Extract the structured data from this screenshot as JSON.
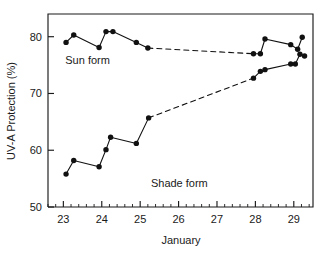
{
  "chart_data": {
    "type": "line",
    "title": "",
    "xlabel": "January",
    "ylabel": "UV-A Protection (%)",
    "xlim": [
      22.6,
      29.5
    ],
    "ylim": [
      50,
      84
    ],
    "xticks": [
      23,
      24,
      25,
      26,
      27,
      28,
      29
    ],
    "xticklabels": [
      "23",
      "24",
      "25",
      "26",
      "27",
      "28",
      "29"
    ],
    "x_minor_step": 0.2,
    "yticks": [
      50,
      60,
      70,
      80
    ],
    "yticklabels": [
      "50",
      "60",
      "70",
      "80"
    ],
    "grid": false,
    "legend_position": "inline-annotations",
    "marker": "filled-circle",
    "marker_color": "#111111",
    "line_color": "#111111",
    "series": [
      {
        "name": "Sun form",
        "label_x": 23.05,
        "label_y": 75.2,
        "segments": [
          {
            "style": "solid",
            "points": [
              {
                "x": 23.07,
                "y": 79.0
              },
              {
                "x": 23.27,
                "y": 80.3
              },
              {
                "x": 23.93,
                "y": 78.1
              },
              {
                "x": 24.11,
                "y": 80.9
              },
              {
                "x": 24.29,
                "y": 80.9
              },
              {
                "x": 24.9,
                "y": 79.0
              },
              {
                "x": 25.2,
                "y": 78.0
              }
            ]
          },
          {
            "style": "dashed",
            "points": [
              {
                "x": 25.2,
                "y": 78.0
              },
              {
                "x": 27.95,
                "y": 77.0
              }
            ]
          },
          {
            "style": "solid",
            "points": [
              {
                "x": 27.95,
                "y": 77.0
              },
              {
                "x": 28.13,
                "y": 77.0
              },
              {
                "x": 28.25,
                "y": 79.6
              },
              {
                "x": 28.92,
                "y": 78.6
              },
              {
                "x": 29.1,
                "y": 77.8
              },
              {
                "x": 29.22,
                "y": 79.9
              }
            ]
          }
        ],
        "values": [
          {
            "x": 23.07,
            "y": 79.0
          },
          {
            "x": 23.27,
            "y": 80.3
          },
          {
            "x": 23.93,
            "y": 78.1
          },
          {
            "x": 24.11,
            "y": 80.9
          },
          {
            "x": 24.29,
            "y": 80.9
          },
          {
            "x": 24.9,
            "y": 79.0
          },
          {
            "x": 25.2,
            "y": 78.0
          },
          {
            "x": 27.95,
            "y": 77.0
          },
          {
            "x": 28.13,
            "y": 77.0
          },
          {
            "x": 28.25,
            "y": 79.6
          },
          {
            "x": 28.92,
            "y": 78.6
          },
          {
            "x": 29.1,
            "y": 77.8
          },
          {
            "x": 29.22,
            "y": 79.9
          }
        ]
      },
      {
        "name": "Shade form",
        "label_x": 25.28,
        "label_y": 53.6,
        "segments": [
          {
            "style": "solid",
            "points": [
              {
                "x": 23.07,
                "y": 55.8
              },
              {
                "x": 23.27,
                "y": 58.2
              },
              {
                "x": 23.93,
                "y": 57.1
              },
              {
                "x": 24.11,
                "y": 60.1
              },
              {
                "x": 24.23,
                "y": 62.3
              },
              {
                "x": 24.9,
                "y": 61.2
              },
              {
                "x": 25.22,
                "y": 65.7
              }
            ]
          },
          {
            "style": "dashed",
            "points": [
              {
                "x": 25.22,
                "y": 65.7
              },
              {
                "x": 27.95,
                "y": 72.7
              }
            ]
          },
          {
            "style": "solid",
            "points": [
              {
                "x": 27.95,
                "y": 72.7
              },
              {
                "x": 28.13,
                "y": 73.9
              },
              {
                "x": 28.25,
                "y": 74.2
              },
              {
                "x": 28.92,
                "y": 75.2
              },
              {
                "x": 29.04,
                "y": 75.2
              },
              {
                "x": 29.16,
                "y": 76.9
              },
              {
                "x": 29.28,
                "y": 76.6
              }
            ]
          }
        ],
        "values": [
          {
            "x": 23.07,
            "y": 55.8
          },
          {
            "x": 23.27,
            "y": 58.2
          },
          {
            "x": 23.93,
            "y": 57.1
          },
          {
            "x": 24.11,
            "y": 60.1
          },
          {
            "x": 24.23,
            "y": 62.3
          },
          {
            "x": 24.9,
            "y": 61.2
          },
          {
            "x": 25.22,
            "y": 65.7
          },
          {
            "x": 27.95,
            "y": 72.7
          },
          {
            "x": 28.13,
            "y": 73.9
          },
          {
            "x": 28.25,
            "y": 74.2
          },
          {
            "x": 28.92,
            "y": 75.2
          },
          {
            "x": 29.04,
            "y": 75.2
          },
          {
            "x": 29.16,
            "y": 76.9
          },
          {
            "x": 29.28,
            "y": 76.6
          }
        ]
      }
    ]
  }
}
